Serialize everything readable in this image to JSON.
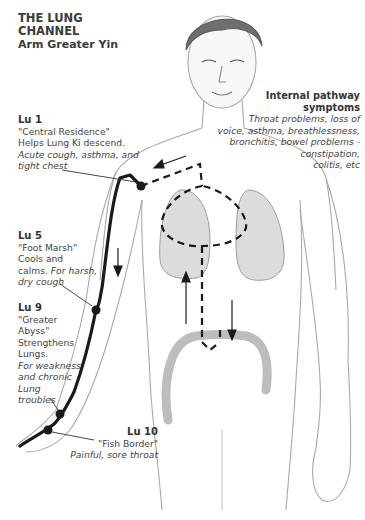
{
  "title": {
    "line1": "THE LUNG",
    "line2": "CHANNEL",
    "subtitle": "Arm Greater Yin"
  },
  "points": [
    {
      "id": "Lu 1",
      "name": "\"Central Residence\"",
      "desc_lines": [
        "Helps Lung Ki descend."
      ],
      "italic_lines": [
        "Acute cough, asthma, and",
        "tight chest"
      ]
    },
    {
      "id": "Lu 5",
      "name": "\"Foot Marsh\"",
      "desc_lines": [
        "Cools and",
        "calms."
      ],
      "italic_lines": [
        "For harsh,",
        "dry cough"
      ]
    },
    {
      "id": "Lu 9",
      "name_lines": [
        "\"Greater",
        "Abyss\""
      ],
      "desc_lines": [
        "Strengthens",
        "Lungs."
      ],
      "italic_lines": [
        "For weakness",
        "and chronic",
        "Lung",
        "troubles"
      ]
    },
    {
      "id": "Lu 10",
      "name": "\"Fish Border\"",
      "italic_lines": [
        "Painful, sore throat"
      ]
    }
  ],
  "internal": {
    "heading_lines": [
      "Internal pathway",
      "symptoms"
    ],
    "italic_lines": [
      "Throat problems, loss of",
      "voice, asthma, breathlessness,",
      "bronchitis, bowel problems -",
      "constipation,",
      "colitis, etc"
    ]
  },
  "colors": {
    "channel": "#1a1a1a",
    "sketch": "#9a9a9a",
    "shade": "#d6d6d6",
    "text": "#444444"
  }
}
